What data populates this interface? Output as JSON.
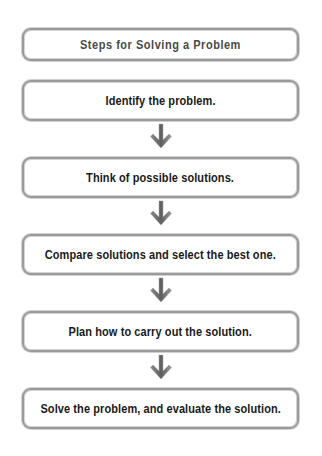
{
  "diagram": {
    "title": "Steps for Solving a Problem",
    "steps": [
      {
        "label": "Identify the problem."
      },
      {
        "label": "Think of possible solutions."
      },
      {
        "label": "Compare solutions and select the best one."
      },
      {
        "label": "Plan how to carry out the solution."
      },
      {
        "label": "Solve the problem, and evaluate the solution."
      }
    ],
    "arrow_icon": "down-arrow-icon",
    "colors": {
      "box_border": "#9a9a9a",
      "arrow": "#6e6e6e",
      "title_text": "#4a4a4a",
      "step_text": "#1a1a1a"
    }
  }
}
